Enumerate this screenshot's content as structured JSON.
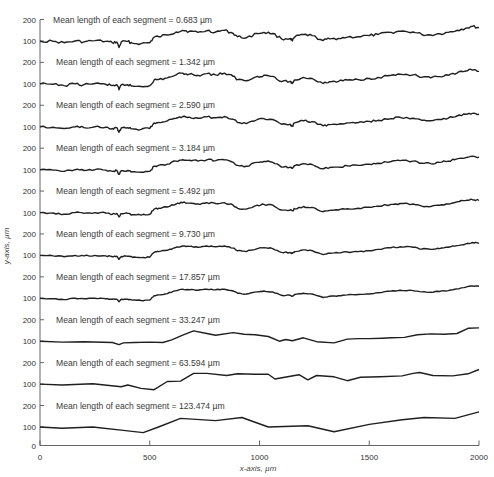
{
  "chart_data": {
    "type": "line",
    "title": "",
    "xlabel": "x-axis, µm",
    "ylabel": "y-axis, µm",
    "xlim": [
      0,
      2000
    ],
    "x_ticks": [
      0,
      500,
      1000,
      1500,
      2000
    ],
    "y_ticks_per_panel": [
      100,
      200
    ],
    "bottom_tick": 0,
    "grid": false,
    "legend": null,
    "layout": "ten vertically stacked surface profiles, each with its own 100/200 y ticks; bottom panel includes 0",
    "series": [
      {
        "name": "Mean length of each segment = 0.683 µm",
        "label_value": "0.683",
        "roughness": 1.0,
        "x": [
          0,
          60,
          110,
          160,
          200,
          250,
          300,
          330,
          350,
          360,
          370,
          400,
          420,
          460,
          500,
          520,
          540,
          580,
          620,
          650,
          680,
          720,
          760,
          800,
          840,
          880,
          900,
          940,
          990,
          1020,
          1060,
          1100,
          1140,
          1150,
          1160,
          1200,
          1240,
          1290,
          1320,
          1360,
          1400,
          1450,
          1500,
          1540,
          1600,
          1640,
          1700,
          1740,
          1780,
          1820,
          1860,
          1900,
          1940,
          1970,
          2000
        ],
        "y": [
          100,
          98,
          92,
          100,
          96,
          102,
          98,
          92,
          96,
          70,
          95,
          98,
          90,
          88,
          92,
          118,
          120,
          128,
          142,
          150,
          145,
          140,
          148,
          142,
          150,
          135,
          120,
          115,
          135,
          140,
          135,
          110,
          112,
          100,
          118,
          130,
          125,
          102,
          110,
          112,
          118,
          120,
          125,
          130,
          140,
          145,
          142,
          130,
          128,
          134,
          140,
          150,
          160,
          168,
          162
        ]
      },
      {
        "name": "Mean length of each segment = 1.342 µm",
        "label_value": "1.342",
        "roughness": 0.9,
        "x": [
          0,
          60,
          110,
          160,
          200,
          250,
          300,
          330,
          350,
          360,
          370,
          400,
          420,
          460,
          500,
          520,
          540,
          580,
          620,
          650,
          680,
          720,
          760,
          800,
          840,
          880,
          900,
          940,
          990,
          1020,
          1060,
          1100,
          1140,
          1150,
          1160,
          1200,
          1240,
          1290,
          1320,
          1360,
          1400,
          1450,
          1500,
          1540,
          1600,
          1640,
          1700,
          1740,
          1780,
          1820,
          1860,
          1900,
          1940,
          1970,
          2000
        ],
        "y": [
          100,
          98,
          92,
          100,
          96,
          102,
          98,
          92,
          96,
          72,
          95,
          96,
          90,
          88,
          92,
          118,
          120,
          128,
          142,
          150,
          145,
          140,
          148,
          142,
          150,
          135,
          120,
          115,
          135,
          140,
          135,
          110,
          112,
          102,
          118,
          130,
          125,
          102,
          110,
          112,
          118,
          120,
          125,
          130,
          140,
          145,
          142,
          130,
          128,
          134,
          140,
          150,
          160,
          164,
          158
        ]
      },
      {
        "name": "Mean length of each segment = 2.590 µm",
        "label_value": "2.590",
        "roughness": 0.8,
        "x": [
          0,
          60,
          110,
          160,
          200,
          250,
          300,
          330,
          350,
          360,
          370,
          400,
          420,
          460,
          500,
          520,
          540,
          580,
          620,
          650,
          680,
          720,
          760,
          800,
          840,
          880,
          900,
          940,
          990,
          1020,
          1060,
          1100,
          1140,
          1150,
          1160,
          1200,
          1240,
          1290,
          1320,
          1360,
          1400,
          1450,
          1500,
          1540,
          1600,
          1640,
          1700,
          1740,
          1780,
          1820,
          1860,
          1900,
          1940,
          1970,
          2000
        ],
        "y": [
          100,
          98,
          92,
          100,
          96,
          100,
          98,
          92,
          96,
          74,
          95,
          96,
          90,
          88,
          92,
          118,
          120,
          128,
          140,
          148,
          145,
          140,
          146,
          142,
          148,
          135,
          120,
          115,
          134,
          138,
          134,
          112,
          112,
          104,
          118,
          128,
          124,
          104,
          110,
          112,
          118,
          120,
          125,
          130,
          138,
          144,
          140,
          130,
          128,
          134,
          140,
          150,
          158,
          162,
          158
        ]
      },
      {
        "name": "Mean length of each segment = 3.184 µm",
        "label_value": "3.184",
        "roughness": 0.7,
        "x": [
          0,
          60,
          110,
          160,
          200,
          250,
          300,
          330,
          350,
          360,
          370,
          400,
          420,
          460,
          500,
          520,
          540,
          580,
          620,
          650,
          680,
          720,
          760,
          800,
          840,
          880,
          900,
          940,
          990,
          1020,
          1060,
          1100,
          1140,
          1150,
          1160,
          1200,
          1240,
          1290,
          1320,
          1360,
          1400,
          1450,
          1500,
          1540,
          1600,
          1640,
          1700,
          1740,
          1780,
          1820,
          1860,
          1900,
          1940,
          1970,
          2000
        ],
        "y": [
          100,
          98,
          92,
          100,
          96,
          100,
          98,
          92,
          96,
          78,
          95,
          96,
          90,
          88,
          92,
          116,
          120,
          126,
          140,
          146,
          144,
          140,
          146,
          142,
          146,
          134,
          120,
          116,
          134,
          138,
          134,
          112,
          112,
          106,
          118,
          128,
          124,
          104,
          110,
          112,
          118,
          120,
          125,
          130,
          138,
          142,
          140,
          130,
          128,
          134,
          140,
          150,
          156,
          162,
          158
        ]
      },
      {
        "name": "Mean length of each segment = 5.492 µm",
        "label_value": "5.492",
        "roughness": 0.6,
        "x": [
          0,
          60,
          110,
          160,
          200,
          250,
          300,
          330,
          350,
          360,
          370,
          400,
          420,
          460,
          500,
          520,
          540,
          580,
          620,
          650,
          680,
          720,
          760,
          800,
          840,
          880,
          900,
          940,
          990,
          1020,
          1060,
          1100,
          1140,
          1150,
          1160,
          1200,
          1240,
          1290,
          1320,
          1360,
          1400,
          1450,
          1500,
          1540,
          1600,
          1640,
          1700,
          1740,
          1780,
          1820,
          1860,
          1900,
          1940,
          1970,
          2000
        ],
        "y": [
          100,
          98,
          92,
          100,
          96,
          100,
          98,
          92,
          96,
          80,
          95,
          96,
          90,
          88,
          92,
          116,
          120,
          126,
          140,
          146,
          144,
          140,
          146,
          142,
          146,
          134,
          120,
          116,
          134,
          138,
          134,
          112,
          112,
          108,
          118,
          128,
          124,
          104,
          110,
          112,
          118,
          120,
          125,
          130,
          138,
          142,
          140,
          130,
          128,
          134,
          140,
          150,
          156,
          160,
          156
        ]
      },
      {
        "name": "Mean length of each segment = 9.730 µm",
        "label_value": "9.730",
        "roughness": 0.45,
        "x": [
          0,
          60,
          110,
          160,
          200,
          250,
          300,
          330,
          350,
          360,
          370,
          400,
          420,
          460,
          500,
          520,
          540,
          580,
          620,
          650,
          680,
          720,
          760,
          800,
          840,
          880,
          900,
          940,
          990,
          1020,
          1060,
          1100,
          1140,
          1150,
          1160,
          1200,
          1240,
          1290,
          1320,
          1360,
          1400,
          1450,
          1500,
          1540,
          1600,
          1640,
          1700,
          1740,
          1780,
          1820,
          1860,
          1900,
          1940,
          1970,
          2000
        ],
        "y": [
          100,
          98,
          94,
          100,
          98,
          100,
          98,
          94,
          96,
          82,
          95,
          96,
          92,
          90,
          92,
          114,
          118,
          124,
          138,
          144,
          142,
          138,
          144,
          140,
          144,
          134,
          122,
          118,
          132,
          136,
          132,
          114,
          114,
          110,
          118,
          126,
          122,
          104,
          110,
          112,
          116,
          118,
          122,
          128,
          136,
          140,
          138,
          130,
          128,
          132,
          138,
          146,
          154,
          160,
          156
        ]
      },
      {
        "name": "Mean length of each segment = 17.857 µm",
        "label_value": "17.857",
        "roughness": 0.3,
        "x": [
          0,
          60,
          110,
          160,
          200,
          250,
          300,
          330,
          350,
          360,
          370,
          400,
          420,
          460,
          500,
          520,
          540,
          580,
          620,
          650,
          680,
          720,
          760,
          800,
          840,
          880,
          900,
          940,
          990,
          1020,
          1060,
          1100,
          1140,
          1150,
          1160,
          1200,
          1240,
          1290,
          1320,
          1360,
          1400,
          1450,
          1500,
          1540,
          1600,
          1640,
          1700,
          1740,
          1780,
          1820,
          1860,
          1900,
          1940,
          1970,
          2000
        ],
        "y": [
          100,
          98,
          94,
          100,
          98,
          100,
          98,
          96,
          96,
          84,
          96,
          96,
          92,
          90,
          92,
          112,
          116,
          122,
          136,
          142,
          140,
          138,
          142,
          140,
          142,
          134,
          124,
          120,
          130,
          134,
          130,
          114,
          114,
          110,
          118,
          124,
          120,
          104,
          110,
          112,
          116,
          118,
          120,
          126,
          134,
          138,
          136,
          130,
          128,
          132,
          136,
          144,
          152,
          158,
          156
        ]
      },
      {
        "name": "Mean length of each segment = 33.247 µm",
        "label_value": "33.247",
        "roughness": 0.0,
        "x": [
          0,
          100,
          200,
          330,
          360,
          380,
          430,
          500,
          560,
          600,
          650,
          700,
          760,
          800,
          880,
          930,
          980,
          1040,
          1090,
          1120,
          1150,
          1200,
          1260,
          1340,
          1400,
          1450,
          1500,
          1560,
          1600,
          1660,
          1720,
          1780,
          1840,
          1900,
          1950,
          2000
        ],
        "y": [
          100,
          96,
          98,
          94,
          84,
          92,
          94,
          96,
          94,
          106,
          128,
          148,
          136,
          128,
          140,
          132,
          130,
          122,
          100,
          108,
          102,
          116,
          98,
          92,
          110,
          112,
          112,
          114,
          116,
          118,
          130,
          134,
          132,
          136,
          160,
          162
        ]
      },
      {
        "name": "Mean length of each segment = 63.594 µm",
        "label_value": "63.594",
        "roughness": 0.0,
        "x": [
          0,
          100,
          240,
          370,
          400,
          460,
          520,
          580,
          640,
          700,
          760,
          850,
          900,
          980,
          1040,
          1070,
          1180,
          1220,
          1260,
          1340,
          1400,
          1460,
          1550,
          1650,
          1700,
          1730,
          1790,
          1880,
          1950,
          2000
        ],
        "y": [
          100,
          96,
          102,
          88,
          96,
          80,
          74,
          112,
          114,
          150,
          150,
          140,
          148,
          146,
          146,
          124,
          144,
          120,
          140,
          134,
          116,
          132,
          134,
          138,
          150,
          154,
          140,
          138,
          148,
          168
        ]
      },
      {
        "name": "Mean length of each segment = 123.474 µm",
        "label_value": "123.474",
        "roughness": 0.0,
        "x": [
          0,
          100,
          240,
          380,
          470,
          540,
          640,
          800,
          920,
          1040,
          1220,
          1340,
          1500,
          1650,
          1750,
          1890,
          2000
        ],
        "y": [
          100,
          94,
          100,
          84,
          74,
          100,
          140,
          130,
          144,
          100,
          106,
          78,
          112,
          134,
          144,
          140,
          170
        ]
      }
    ]
  },
  "labels": {
    "prefix": "Mean length of each segment =",
    "unit": "µm",
    "xlabel": "x-axis, µm",
    "ylabel": "y-axis, µm",
    "x_tick_labels": [
      "0",
      "500",
      "1000",
      "1500",
      "2000"
    ],
    "y_tick_200": "200",
    "y_tick_100": "100",
    "y_tick_0": "0"
  }
}
